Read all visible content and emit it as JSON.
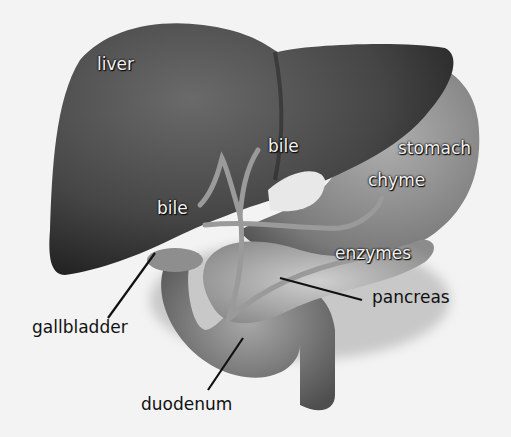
{
  "diagram": {
    "type": "anatomical-illustration",
    "colors": {
      "background": "#f3f3f3",
      "liver": "#3c3c3c",
      "liver_highlight": "#6a6a6a",
      "stomach": "#8a8a8a",
      "duct": "#9a9a9a",
      "leader_line": "#111111",
      "label_in": "#f2f2f2",
      "label_out": "#111111"
    },
    "labels": {
      "liver": "liver",
      "bile_upper": "bile",
      "bile_lower": "bile",
      "stomach": "stomach",
      "chyme": "chyme",
      "enzymes": "enzymes",
      "pancreas": "pancreas",
      "gallbladder": "gallbladder",
      "duodenum": "duodenum"
    }
  }
}
